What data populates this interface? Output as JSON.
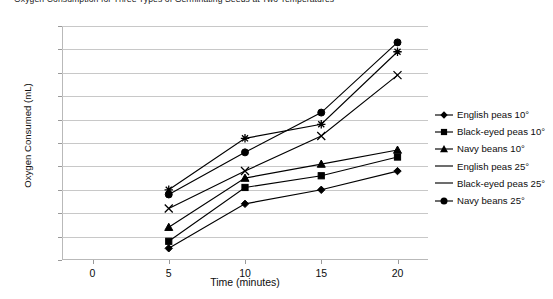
{
  "chart_data": {
    "type": "line",
    "title": "Oxygen Consumption for Three Types of Germinating Seeds at Two Temperatures",
    "xlabel": "Time (minutes)",
    "ylabel": "Oxygen Consumed (mL)",
    "x": [
      5,
      10,
      15,
      20
    ],
    "xticks": [
      "0",
      "5",
      "10",
      "15",
      "20"
    ],
    "xtick_values": [
      0,
      5,
      10,
      15,
      20
    ],
    "xlim": [
      -2,
      22
    ],
    "ylim": [
      0,
      0.5
    ],
    "yticks": [
      "0",
      "0.05",
      "0.1",
      "0.15",
      "0.2",
      "0.25",
      "0.3",
      "0.35",
      "0.4",
      "0.45",
      "0.5"
    ],
    "ytick_values": [
      0,
      0.05,
      0.1,
      0.15,
      0.2,
      0.25,
      0.3,
      0.35,
      0.4,
      0.45,
      0.5
    ],
    "grid": true,
    "legend_position": "right",
    "series": [
      {
        "name": "English peas 10°",
        "marker": "diamond",
        "values": [
          0.025,
          0.12,
          0.15,
          0.19
        ]
      },
      {
        "name": "Black-eyed peas 10°",
        "marker": "square",
        "values": [
          0.04,
          0.155,
          0.18,
          0.22
        ]
      },
      {
        "name": "Navy beans 10°",
        "marker": "triangle",
        "values": [
          0.07,
          0.175,
          0.205,
          0.235
        ]
      },
      {
        "name": "English peas 25°",
        "marker": "cross",
        "values": [
          0.11,
          0.19,
          0.265,
          0.395
        ]
      },
      {
        "name": "Black-eyed peas 25°",
        "marker": "asterisk",
        "values": [
          0.15,
          0.26,
          0.29,
          0.445
        ]
      },
      {
        "name": "Navy beans 25°",
        "marker": "circle",
        "values": [
          0.14,
          0.23,
          0.315,
          0.465
        ]
      }
    ]
  }
}
